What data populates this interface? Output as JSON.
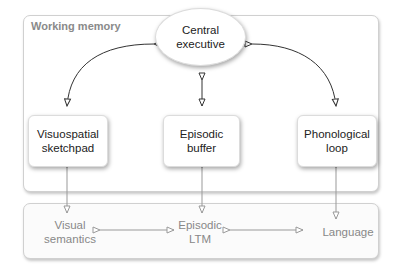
{
  "working_memory": {
    "title": "Working memory",
    "central_executive": "Central executive",
    "central_executive_lines": [
      "Central",
      "executive"
    ],
    "components": [
      {
        "lines": [
          "Visuospatial",
          "sketchpad"
        ]
      },
      {
        "lines": [
          "Episodic",
          "buffer"
        ]
      },
      {
        "lines": [
          "Phonological",
          "loop"
        ]
      }
    ]
  },
  "long_term": {
    "items": [
      {
        "lines": [
          "Visual",
          "semantics"
        ]
      },
      {
        "lines": [
          "Episodic",
          "LTM"
        ]
      },
      {
        "lines": [
          "Language"
        ]
      }
    ]
  },
  "colors": {
    "arrow_dark": "#333333",
    "arrow_light": "#999999",
    "panel_title": "#8a8a8a",
    "ltm_text": "#888888"
  }
}
